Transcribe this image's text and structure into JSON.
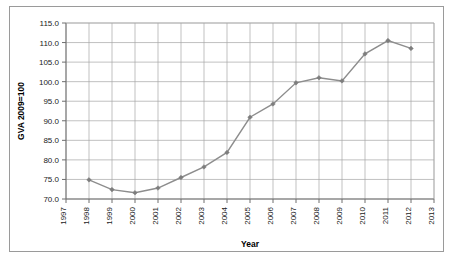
{
  "figure": {
    "border_color": "#9a9a9a",
    "background": "#ffffff"
  },
  "chart_data": {
    "type": "line",
    "title": "",
    "xlabel": "Year",
    "ylabel": "GVA 2009=100",
    "x": [
      1998,
      1999,
      2000,
      2001,
      2002,
      2003,
      2004,
      2005,
      2006,
      2007,
      2008,
      2009,
      2010,
      2011,
      2012
    ],
    "values": [
      74.9,
      72.4,
      71.6,
      72.8,
      75.5,
      78.2,
      81.9,
      90.9,
      94.3,
      99.7,
      101.0,
      100.2,
      107.1,
      110.5,
      108.5
    ],
    "series": [
      {
        "name": "GVA index",
        "color": "#8d8d8d",
        "marker": "diamond",
        "values": [
          74.9,
          72.4,
          71.6,
          72.8,
          75.5,
          78.2,
          81.9,
          90.9,
          94.3,
          99.7,
          101.0,
          100.2,
          107.1,
          110.5,
          108.5
        ]
      }
    ],
    "xlim": [
      1997,
      2013
    ],
    "ylim": [
      70.0,
      115.0
    ],
    "xticks": [
      1997,
      1998,
      1999,
      2000,
      2001,
      2002,
      2003,
      2004,
      2005,
      2006,
      2007,
      2008,
      2009,
      2010,
      2011,
      2012,
      2013
    ],
    "xtick_labels": [
      "1997",
      "1998",
      "1999",
      "2000",
      "2001",
      "2002",
      "2003",
      "2004",
      "2005",
      "2006",
      "2007",
      "2008",
      "2009",
      "2010",
      "2011",
      "2012",
      "2013"
    ],
    "yticks": [
      70.0,
      75.0,
      80.0,
      85.0,
      90.0,
      95.0,
      100.0,
      105.0,
      110.0,
      115.0
    ],
    "ytick_labels": [
      "70.0",
      "75.0",
      "80.0",
      "85.0",
      "90.0",
      "95.0",
      "100.0",
      "105.0",
      "110.0",
      "115.0"
    ],
    "grid": {
      "horizontal": true,
      "vertical": true,
      "color": "#a6a6a6"
    },
    "legend": {
      "visible": false,
      "position": "none"
    }
  }
}
